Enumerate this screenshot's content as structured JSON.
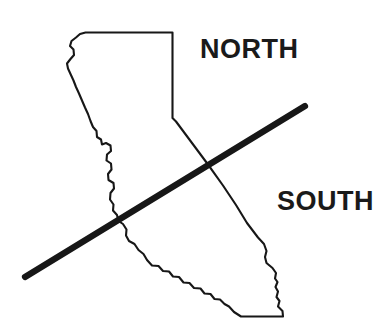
{
  "figure": {
    "background_color": "#ffffff",
    "ink_color": "#171717",
    "width": 390,
    "height": 334
  },
  "labels": {
    "north": "NORTH",
    "south": "SOUTH"
  },
  "map": {
    "subject": "California state outline",
    "outline_color": "#171717",
    "outline_width": 2.1,
    "fill": "none"
  },
  "divider": {
    "name": "north-south-dividing-line",
    "color": "#171717",
    "thickness": 6.2,
    "start_x": 25,
    "start_y": 277,
    "end_x": 305,
    "end_y": 106
  },
  "label_positions": {
    "north_x": 200,
    "north_y": 58,
    "south_x": 277,
    "south_y": 210
  }
}
